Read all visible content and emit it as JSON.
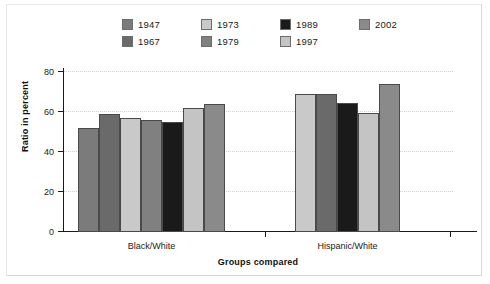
{
  "chart_data": {
    "type": "bar",
    "title": "",
    "xlabel": "Groups compared",
    "ylabel": "Ratio in percent",
    "ylim": [
      0,
      80
    ],
    "yticks": [
      0,
      20,
      40,
      60,
      80
    ],
    "grid": true,
    "legend_position": "top",
    "categories": [
      "Black/White",
      "Hispanic/White"
    ],
    "series": [
      {
        "name": "1947",
        "color": "#7b7b7b",
        "values": [
          52,
          null
        ]
      },
      {
        "name": "1967",
        "color": "#6a6a6a",
        "values": [
          59,
          69
        ]
      },
      {
        "name": "1973",
        "color": "#c9c9c9",
        "values": [
          57,
          69
        ]
      },
      {
        "name": "1979",
        "color": "#808080",
        "values": [
          56,
          null
        ]
      },
      {
        "name": "1989",
        "color": "#1a1a1a",
        "values": [
          55,
          64.5
        ]
      },
      {
        "name": "1997",
        "color": "#c4c4c4",
        "values": [
          62,
          59.5
        ]
      },
      {
        "name": "2002",
        "color": "#8a8a8a",
        "values": [
          64,
          74
        ]
      }
    ],
    "legend": [
      {
        "label": "1947",
        "color": "#7b7b7b"
      },
      {
        "label": "1967",
        "color": "#6a6a6a"
      },
      {
        "label": "1973",
        "color": "#c9c9c9"
      },
      {
        "label": "1979",
        "color": "#808080"
      },
      {
        "label": "1989",
        "color": "#1a1a1a"
      },
      {
        "label": "1997",
        "color": "#c4c4c4"
      },
      {
        "label": "2002",
        "color": "#8a8a8a"
      }
    ],
    "groups": [
      {
        "name": "Black/White",
        "bars": [
          {
            "series": "1947",
            "value": 52,
            "color": "#7b7b7b"
          },
          {
            "series": "1967",
            "value": 59,
            "color": "#6a6a6a"
          },
          {
            "series": "1973",
            "value": 57,
            "color": "#c9c9c9"
          },
          {
            "series": "1979",
            "value": 56,
            "color": "#808080"
          },
          {
            "series": "1989",
            "value": 55,
            "color": "#1a1a1a"
          },
          {
            "series": "1997",
            "value": 62,
            "color": "#c4c4c4"
          },
          {
            "series": "2002",
            "value": 64,
            "color": "#8a8a8a"
          }
        ]
      },
      {
        "name": "Hispanic/White",
        "bars": [
          {
            "series": "1973",
            "value": 69,
            "color": "#c9c9c9"
          },
          {
            "series": "1967",
            "value": 69,
            "color": "#6a6a6a"
          },
          {
            "series": "1989",
            "value": 64.5,
            "color": "#1a1a1a"
          },
          {
            "series": "1997",
            "value": 59.5,
            "color": "#c4c4c4"
          },
          {
            "series": "2002",
            "value": 74,
            "color": "#8a8a8a"
          }
        ]
      }
    ]
  }
}
